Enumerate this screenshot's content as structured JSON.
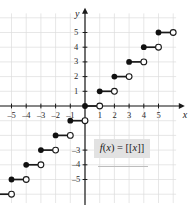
{
  "figure": {
    "axis_labels": {
      "x": "x",
      "y": "y"
    },
    "formula": "f(x) = [[x]]",
    "formula_parts": {
      "fn": "f",
      "arg_open": "(",
      "arg": "x",
      "arg_close": ")",
      "equals": " = ",
      "bracket_open": "[[",
      "bracket_arg": "x",
      "bracket_close": "]]"
    }
  },
  "chart_data": {
    "type": "line",
    "title": "f(x) = [[x]]",
    "xlabel": "x",
    "ylabel": "y",
    "xlim": [
      -6.2,
      6.2
    ],
    "ylim": [
      -6.5,
      6.2
    ],
    "grid": true,
    "grid_step": 1,
    "legend": "none",
    "x_ticks": [
      -5,
      -4,
      -3,
      -2,
      -1,
      1,
      2,
      3,
      4,
      5
    ],
    "x_tick_labels": [
      "-5",
      "-4",
      "-3",
      "-2",
      "-1",
      "1",
      "2",
      "3",
      "4",
      "5"
    ],
    "y_ticks": [
      5,
      4,
      3,
      2,
      1,
      -3,
      -4,
      -5
    ],
    "y_tick_labels": [
      "5",
      "4",
      "3",
      "2",
      "1",
      "-3",
      "-4",
      "-5"
    ],
    "segments": [
      {
        "x_start": -6,
        "x_end": -5,
        "y": -6,
        "left_endpoint": "closed",
        "right_endpoint": "open"
      },
      {
        "x_start": -5,
        "x_end": -4,
        "y": -5,
        "left_endpoint": "closed",
        "right_endpoint": "open"
      },
      {
        "x_start": -4,
        "x_end": -3,
        "y": -4,
        "left_endpoint": "closed",
        "right_endpoint": "open"
      },
      {
        "x_start": -3,
        "x_end": -2,
        "y": -3,
        "left_endpoint": "closed",
        "right_endpoint": "open"
      },
      {
        "x_start": -2,
        "x_end": -1,
        "y": -2,
        "left_endpoint": "closed",
        "right_endpoint": "open"
      },
      {
        "x_start": -1,
        "x_end": 0,
        "y": -1,
        "left_endpoint": "closed",
        "right_endpoint": "open"
      },
      {
        "x_start": 0,
        "x_end": 1,
        "y": 0,
        "left_endpoint": "closed",
        "right_endpoint": "open"
      },
      {
        "x_start": 1,
        "x_end": 2,
        "y": 1,
        "left_endpoint": "closed",
        "right_endpoint": "open"
      },
      {
        "x_start": 2,
        "x_end": 3,
        "y": 2,
        "left_endpoint": "closed",
        "right_endpoint": "open"
      },
      {
        "x_start": 3,
        "x_end": 4,
        "y": 3,
        "left_endpoint": "closed",
        "right_endpoint": "open"
      },
      {
        "x_start": 4,
        "x_end": 5,
        "y": 4,
        "left_endpoint": "closed",
        "right_endpoint": "open"
      },
      {
        "x_start": 5,
        "x_end": 6,
        "y": 5,
        "left_endpoint": "closed",
        "right_endpoint": "open"
      }
    ],
    "colors": {
      "curve": "#1a1a1a",
      "axis": "#1a1a1a",
      "grid": "#dcdcdc",
      "filled_dot": "#111111",
      "open_dot_fill": "#ffffff",
      "formula_box": "#e2e2e2"
    }
  }
}
